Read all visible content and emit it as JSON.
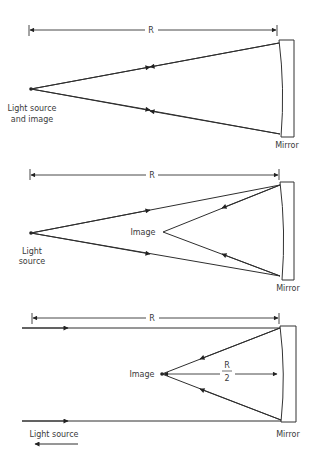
{
  "panels": [
    {
      "id": "center-of-curvature",
      "dimension_label": "R",
      "source_label": [
        "Light source",
        "and image"
      ],
      "mirror_label": "Mirror"
    },
    {
      "id": "beyond-focus",
      "dimension_label": "R",
      "source_label": [
        "Light",
        "source"
      ],
      "image_label": "Image",
      "mirror_label": "Mirror"
    },
    {
      "id": "at-infinity",
      "dimension_label": "R",
      "half_radius_label": [
        "R",
        "2"
      ],
      "image_label": "Image",
      "source_label": "Light source",
      "mirror_label": "Mirror"
    }
  ]
}
